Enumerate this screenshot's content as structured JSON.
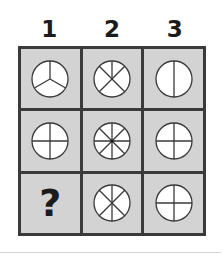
{
  "puzzle": {
    "column_headers": [
      "1",
      "2",
      "3"
    ],
    "colors": {
      "cell_background": "#d3d3d3",
      "grid_border": "#3a3a3a",
      "circle_fill": "#ffffff",
      "line_color": "#3a3a3a"
    },
    "cells": [
      {
        "row": 1,
        "col": 1,
        "type": "circle",
        "segments": 3,
        "icon": "circle-3-segments-icon"
      },
      {
        "row": 1,
        "col": 2,
        "type": "circle",
        "segments": 5,
        "icon": "circle-5-segments-icon"
      },
      {
        "row": 1,
        "col": 3,
        "type": "circle",
        "segments": 2,
        "icon": "circle-2-segments-icon"
      },
      {
        "row": 2,
        "col": 1,
        "type": "circle",
        "segments": 4,
        "icon": "circle-4-segments-icon"
      },
      {
        "row": 2,
        "col": 2,
        "type": "circle",
        "segments": 8,
        "icon": "circle-8-segments-icon"
      },
      {
        "row": 2,
        "col": 3,
        "type": "circle",
        "segments": 4,
        "icon": "circle-4-segments-icon"
      },
      {
        "row": 3,
        "col": 1,
        "type": "unknown",
        "label": "?"
      },
      {
        "row": 3,
        "col": 2,
        "type": "circle",
        "segments": 6,
        "icon": "circle-6-segments-icon"
      },
      {
        "row": 3,
        "col": 3,
        "type": "circle",
        "segments": 4,
        "icon": "circle-4-segments-icon"
      }
    ]
  }
}
